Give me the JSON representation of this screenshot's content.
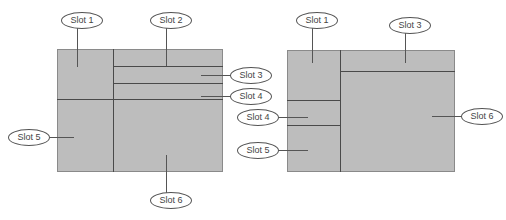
{
  "colors": {
    "fill": "#bdbdbd",
    "divider": "#4a4a4a",
    "leader": "#555555",
    "label_border": "#555555",
    "label_text": "#444444"
  },
  "diagrams": [
    {
      "name": "layout-a",
      "slots": [
        {
          "id": "slot-1",
          "label": "Slot 1"
        },
        {
          "id": "slot-2",
          "label": "Slot 2"
        },
        {
          "id": "slot-3",
          "label": "Slot 3"
        },
        {
          "id": "slot-4",
          "label": "Slot 4"
        },
        {
          "id": "slot-5",
          "label": "Slot 5"
        },
        {
          "id": "slot-6",
          "label": "Slot 6"
        }
      ]
    },
    {
      "name": "layout-b",
      "slots": [
        {
          "id": "slot-1",
          "label": "Slot 1"
        },
        {
          "id": "slot-3",
          "label": "Slot 3"
        },
        {
          "id": "slot-4",
          "label": "Slot 4"
        },
        {
          "id": "slot-5",
          "label": "Slot 5"
        },
        {
          "id": "slot-6",
          "label": "Slot 6"
        }
      ]
    }
  ]
}
